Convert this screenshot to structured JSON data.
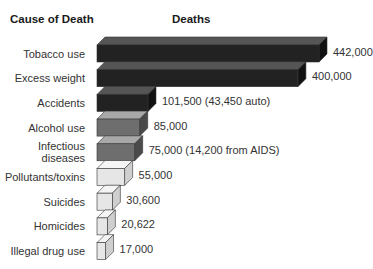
{
  "header": {
    "category_label": "Cause of Death",
    "value_label": "Deaths"
  },
  "chart_data": {
    "type": "bar",
    "orientation": "horizontal",
    "style": "3d",
    "title": "",
    "xlabel": "Deaths",
    "ylabel": "Cause of Death",
    "categories": [
      "Tobacco use",
      "Excess weight",
      "Accidents",
      "Alcohol use",
      "Infectious diseases",
      "Pollutants/toxins",
      "Suicides",
      "Homicides",
      "Illegal drug use"
    ],
    "values": [
      442000,
      400000,
      101500,
      85000,
      75000,
      55000,
      30600,
      20622,
      17000
    ],
    "labels": [
      "442,000",
      "400,000",
      "101,500 (43,450 auto)",
      "85,000",
      "75,000 (14,200 from AIDS)",
      "55,000",
      "30,600",
      "20,622",
      "17,000"
    ],
    "colors": {
      "dark": {
        "front": "#222222",
        "top": "#555555",
        "side": "#111111"
      },
      "medium": {
        "front": "#6e6e6e",
        "top": "#a8a8a8",
        "side": "#4a4a4a"
      },
      "light": {
        "front": "#e6e6e6",
        "top": "#f4f4f4",
        "side": "#cfcfcf"
      }
    },
    "shades": [
      "dark",
      "dark",
      "dark",
      "medium",
      "medium",
      "light",
      "light",
      "light",
      "light"
    ],
    "grid": false,
    "legend": false
  },
  "rows": [
    {
      "label": "Tobacco use",
      "label_lines": [
        "Tobacco use"
      ],
      "value_text": "442,000"
    },
    {
      "label": "Excess weight",
      "label_lines": [
        "Excess weight"
      ],
      "value_text": "400,000"
    },
    {
      "label": "Accidents",
      "label_lines": [
        "Accidents"
      ],
      "value_text": "101,500 (43,450 auto)"
    },
    {
      "label": "Alcohol use",
      "label_lines": [
        "Alcohol use"
      ],
      "value_text": "85,000"
    },
    {
      "label": "Infectious diseases",
      "label_lines": [
        "Infectious",
        "diseases"
      ],
      "value_text": "75,000 (14,200 from AIDS)"
    },
    {
      "label": "Pollutants/toxins",
      "label_lines": [
        "Pollutants/toxins"
      ],
      "value_text": "55,000"
    },
    {
      "label": "Suicides",
      "label_lines": [
        "Suicides"
      ],
      "value_text": "30,600"
    },
    {
      "label": "Homicides",
      "label_lines": [
        "Homicides"
      ],
      "value_text": "20,622"
    },
    {
      "label": "Illegal drug use",
      "label_lines": [
        "Illegal drug use"
      ],
      "value_text": "17,000"
    }
  ]
}
